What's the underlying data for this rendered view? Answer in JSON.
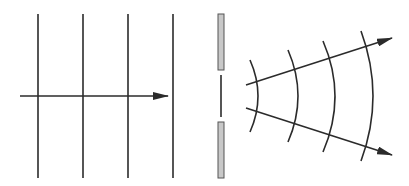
{
  "diagram": {
    "title": "",
    "colors": {
      "stroke": "#2b2b2b",
      "barrier_fill": "#c8c8c8",
      "barrier_stroke": "#555555",
      "background": "#ffffff"
    },
    "incident_wave": {
      "wavefronts_x": [
        38,
        83,
        128,
        173
      ],
      "y_top": 14,
      "y_bottom": 178,
      "arrow": {
        "x1": 20,
        "y1": 96,
        "x2": 168,
        "y2": 96
      }
    },
    "barrier": {
      "top_slab": {
        "x": 218,
        "y": 14,
        "w": 6,
        "h": 56
      },
      "bottom_slab": {
        "x": 218,
        "y": 122,
        "w": 6,
        "h": 56
      },
      "slit_line": {
        "x": 221,
        "y1": 75,
        "y2": 117
      }
    },
    "diffracted_wave": {
      "arcs": [
        {
          "x_top": 250,
          "y_top": 60,
          "x_mid": 258,
          "x_bottom": 250,
          "y_bottom": 132
        },
        {
          "x_top": 288,
          "y_top": 50,
          "x_mid": 298,
          "x_bottom": 288,
          "y_bottom": 142
        },
        {
          "x_top": 323,
          "y_top": 41,
          "x_mid": 335,
          "x_bottom": 323,
          "y_bottom": 152
        },
        {
          "x_top": 361,
          "y_top": 31,
          "x_mid": 373,
          "x_bottom": 361,
          "y_bottom": 161
        }
      ],
      "arrows": [
        {
          "x1": 246,
          "y1": 85,
          "x2": 392,
          "y2": 38
        },
        {
          "x1": 246,
          "y1": 108,
          "x2": 392,
          "y2": 155
        }
      ]
    }
  }
}
